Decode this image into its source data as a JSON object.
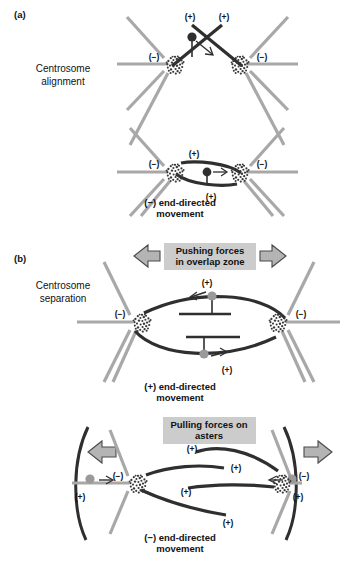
{
  "figure": {
    "background_color": "#ffffff",
    "colors": {
      "astral_microtubule": "#a8a8a8",
      "interpolar_microtubule": "#2f2f2f",
      "motor_dark": "#2f2f2f",
      "motor_gray": "#9a9a9a",
      "force_arrow_fill": "#b4b4b4",
      "force_label_box": "#cccccc",
      "text": "#111111"
    }
  },
  "panels": [
    {
      "id": "a",
      "letter": "(a)",
      "side_label_line1": "Centrosome",
      "side_label_line2": "alignment",
      "subpanels": [
        {
          "id": "a-top",
          "name": "crossed-microtubules",
          "polarity_labels": [
            {
              "text": "(+)",
              "position": "upper-left-crossing-mt"
            },
            {
              "text": "(+)",
              "position": "upper-right-crossing-mt"
            },
            {
              "text": "(−)",
              "position": "left-centrosome"
            },
            {
              "text": "(−)",
              "position": "right-centrosome"
            }
          ],
          "motor_count": 1,
          "motor_type": "dark",
          "motor_arrow": "diagonal-down-right-open"
        },
        {
          "id": "a-bottom",
          "name": "antiparallel-overlap",
          "polarity_labels": [
            {
              "text": "(+)",
              "position": "above-upper-mt"
            },
            {
              "text": "(+)",
              "position": "below-lower-mt"
            },
            {
              "text": "(−)",
              "position": "left-centrosome"
            },
            {
              "text": "(−)",
              "position": "right-centrosome"
            }
          ],
          "motor_count": 1,
          "motor_type": "dark",
          "motor_arrow": "right-open",
          "caption_line1": "(−) end-directed",
          "caption_line2": "movement"
        }
      ]
    },
    {
      "id": "b",
      "letter": "(b)",
      "side_label_line1": "Centrosome",
      "side_label_line2": "separation",
      "subpanels": [
        {
          "id": "b-top",
          "name": "pushing-forces-overlap-zone",
          "force_label_line1": "Pushing forces",
          "force_label_line2": "in overlap zone",
          "force_arrows": [
            {
              "direction": "left",
              "position": "left-of-label"
            },
            {
              "direction": "right",
              "position": "right-of-label"
            }
          ],
          "polarity_labels": [
            {
              "text": "(+)",
              "position": "top-center"
            },
            {
              "text": "(+)",
              "position": "bottom-center"
            },
            {
              "text": "(−)",
              "position": "left-centrosome"
            },
            {
              "text": "(−)",
              "position": "right-centrosome"
            }
          ],
          "motor_count": 2,
          "motor_type": "gray",
          "motor_arrows": [
            "left",
            "right"
          ],
          "caption_line1": "(+) end-directed",
          "caption_line2": "movement"
        },
        {
          "id": "b-bottom",
          "name": "pulling-forces-on-asters",
          "force_label_line1": "Pulling forces on",
          "force_label_line2": "asters",
          "force_arrows": [
            {
              "direction": "left",
              "position": "left-cortex"
            },
            {
              "direction": "right",
              "position": "right-cortex"
            }
          ],
          "polarity_labels": [
            {
              "text": "(+)",
              "position": "interpolar-mt-1-right"
            },
            {
              "text": "(+)",
              "position": "interpolar-mt-2-right"
            },
            {
              "text": "(+)",
              "position": "interpolar-mt-3-left"
            },
            {
              "text": "(+)",
              "position": "interpolar-mt-4-left"
            },
            {
              "text": "(−)",
              "position": "left-astral-mt"
            },
            {
              "text": "(−)",
              "position": "right-astral-mt"
            },
            {
              "text": "(+)",
              "position": "left-cortex-mt"
            },
            {
              "text": "(+)",
              "position": "right-cortex-mt"
            }
          ],
          "motor_count": 2,
          "motor_type": "gray",
          "motor_arrows": [
            "right",
            "left"
          ],
          "cortex_arcs": 2,
          "caption_line1": "(−) end-directed",
          "caption_line2": "movement"
        }
      ]
    }
  ],
  "text_tokens": {
    "plus": "(+)",
    "minus": "(−)"
  }
}
